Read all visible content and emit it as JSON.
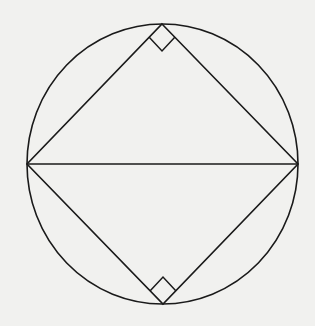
{
  "diagram": {
    "colors": {
      "background": "#f1f1ef",
      "stroke": "#1a1a1a"
    },
    "circle": {
      "cx": 162.5,
      "cy": 164,
      "rx": 135.5,
      "ry": 140
    },
    "vertices": {
      "top": [
        162,
        24
      ],
      "right": [
        298,
        164
      ],
      "bottom": [
        163,
        304
      ],
      "left": [
        27,
        164
      ]
    },
    "diameter": {
      "from": "left",
      "to": "right"
    },
    "right_angle_markers": [
      {
        "at": "top",
        "points": "149,37 162,51 175,37"
      },
      {
        "at": "bottom",
        "points": "150,291 163,277 176,291"
      }
    ],
    "labels": []
  }
}
